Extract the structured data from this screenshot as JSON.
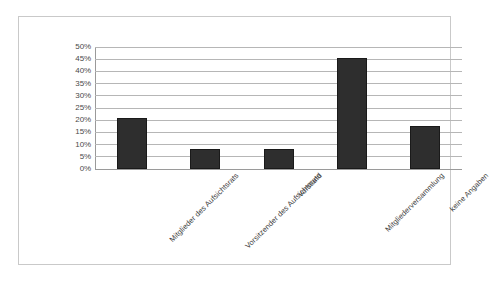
{
  "chart_data": {
    "type": "bar",
    "title": "",
    "subtitle": "",
    "xlabel": "",
    "ylabel": "",
    "categories": [
      "Mitglieder des Aufsichtsrats",
      "Vorsitzender des Aufsichtsrats",
      "Vorstand",
      "Mitgliederversammlung",
      "keine Angaben"
    ],
    "values": [
      21,
      8,
      8,
      45.5,
      17.5
    ],
    "value_labels": [
      "21%",
      "8%",
      "8%",
      "45.5%",
      "17.5%"
    ],
    "ylim": [
      0,
      50
    ],
    "ytick_values": [
      0,
      5,
      10,
      15,
      20,
      25,
      30,
      35,
      40,
      45,
      50
    ],
    "ytick_labels": [
      "0%",
      "5%",
      "10%",
      "15%",
      "20%",
      "25%",
      "30%",
      "35%",
      "40%",
      "45%",
      "50%"
    ],
    "grid": true,
    "legend": false,
    "legend_position": "none",
    "series": [
      {
        "name": "Anteil",
        "values": [
          21,
          8,
          8,
          45.5,
          17.5
        ]
      }
    ],
    "colors": {
      "bar_fill": "#2e2e2e",
      "bar_edge": "#1a1a1a",
      "gridline": "#b6b6b6",
      "axis": "#9a9a9a",
      "frame": "#c9c9c9",
      "tick_text": "#4a4a4a",
      "category_text": "#3b3b3b",
      "background": "#ffffff"
    },
    "annotations": []
  }
}
